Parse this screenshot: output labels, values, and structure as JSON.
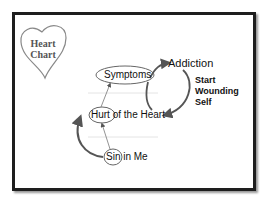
{
  "heart_label": {
    "line1": "Heart",
    "line2": "Chart"
  },
  "nodes": {
    "symptoms": "Symptoms",
    "addiction": "Addiction",
    "hurt_circled": "Hurt",
    "hurt_rest": " of the Heart",
    "sin_circled": "Sin",
    "sin_rest": " in Me"
  },
  "cycle_label": {
    "line1": "Start",
    "line2": "Wounding",
    "line3": "Self"
  },
  "colors": {
    "frame": "#1e1e1e",
    "arrow": "#555555",
    "text": "#111111"
  }
}
